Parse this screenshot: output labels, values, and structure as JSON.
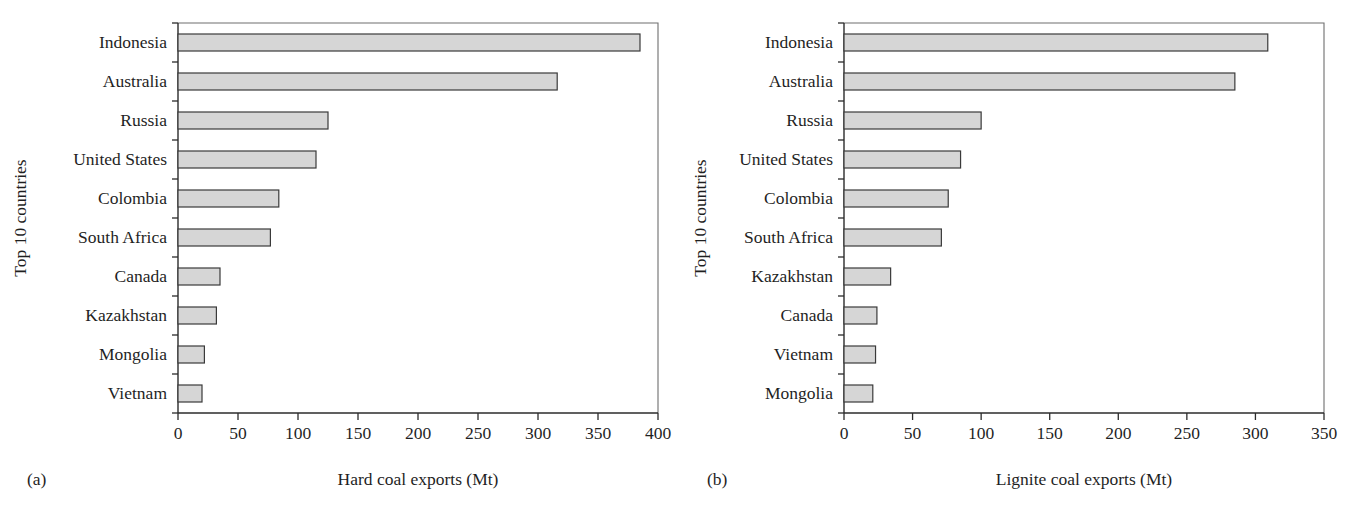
{
  "figure": {
    "panels": [
      {
        "tag": "(a)",
        "xlabel": "Hard coal exports (Mt)",
        "ylabel": "Top 10 countries"
      },
      {
        "tag": "(b)",
        "xlabel": "Lignite coal exports (Mt)",
        "ylabel": "Top 10 countries"
      }
    ],
    "bar_fill": "#d6d6d6",
    "bar_stroke": "#3a3a3a"
  },
  "chart_data": [
    {
      "type": "bar",
      "orientation": "horizontal",
      "title": "",
      "xlabel": "Hard coal exports (Mt)",
      "ylabel": "Top 10 countries",
      "xlim": [
        0,
        400
      ],
      "xticks": [
        0,
        50,
        100,
        150,
        200,
        250,
        300,
        350,
        400
      ],
      "xtick_labels": [
        "0",
        "50",
        "100",
        "150",
        "200",
        "250",
        "300",
        "350",
        "400"
      ],
      "grid": false,
      "legend": false,
      "categories": [
        "Indonesia",
        "Australia",
        "Russia",
        "United States",
        "Colombia",
        "South Africa",
        "Canada",
        "Kazakhstan",
        "Mongolia",
        "Vietnam"
      ],
      "values": [
        385,
        316,
        125,
        115,
        84,
        77,
        35,
        32,
        22,
        20
      ]
    },
    {
      "type": "bar",
      "orientation": "horizontal",
      "title": "",
      "xlabel": "Lignite coal exports (Mt)",
      "ylabel": "Top 10 countries",
      "xlim": [
        0,
        350
      ],
      "xticks": [
        0,
        50,
        100,
        150,
        200,
        250,
        300,
        350
      ],
      "xtick_labels": [
        "0",
        "50",
        "100",
        "150",
        "200",
        "250",
        "300",
        "350"
      ],
      "grid": false,
      "legend": false,
      "categories": [
        "Indonesia",
        "Australia",
        "Russia",
        "United States",
        "Colombia",
        "South Africa",
        "Kazakhstan",
        "Canada",
        "Vietnam",
        "Mongolia"
      ],
      "values": [
        309,
        285,
        100,
        85,
        76,
        71,
        34,
        24,
        23,
        21
      ]
    }
  ]
}
